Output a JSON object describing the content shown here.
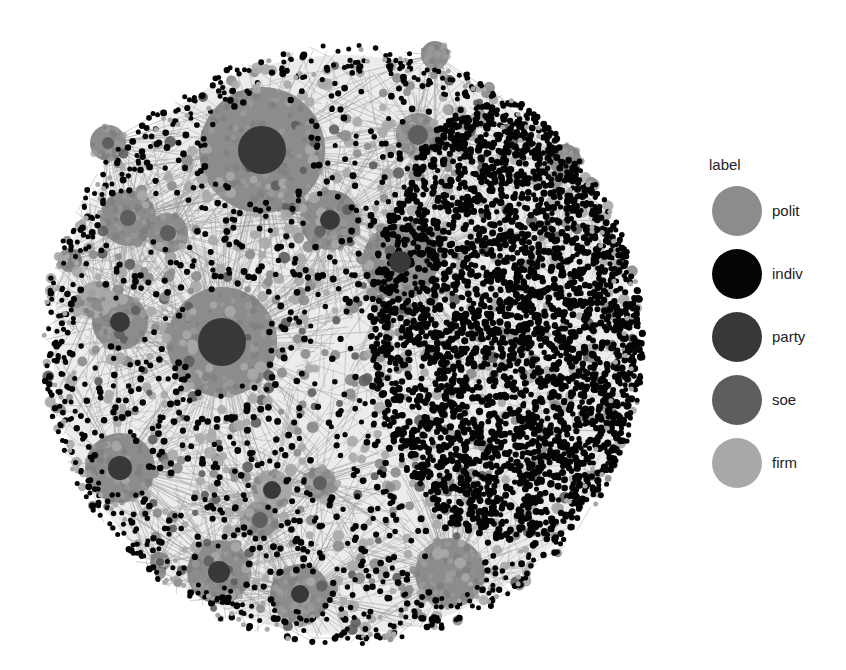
{
  "chart_data": {
    "type": "network",
    "title": "",
    "legend": {
      "title": "label",
      "position": "right",
      "entries": [
        {
          "key": "polit",
          "color": "#8c8c8c"
        },
        {
          "key": "indiv",
          "color": "#050505"
        },
        {
          "key": "party",
          "color": "#383838"
        },
        {
          "key": "soe",
          "color": "#5e5e5e"
        },
        {
          "key": "firm",
          "color": "#a8a8a8"
        }
      ]
    },
    "layout": {
      "center": [
        343,
        345
      ],
      "radius": 300
    },
    "hubs": [
      {
        "x": 262,
        "y": 150,
        "r": 63,
        "core_r": 24,
        "core": "party",
        "halo": "polit"
      },
      {
        "x": 222,
        "y": 342,
        "r": 55,
        "core_r": 24,
        "core": "party",
        "halo": "polit"
      },
      {
        "x": 120,
        "y": 468,
        "r": 35,
        "core_r": 12,
        "core": "party",
        "halo": "polit"
      },
      {
        "x": 219,
        "y": 572,
        "r": 32,
        "core_r": 11,
        "core": "party",
        "halo": "polit"
      },
      {
        "x": 300,
        "y": 594,
        "r": 30,
        "core_r": 9,
        "core": "party",
        "halo": "polit"
      },
      {
        "x": 450,
        "y": 573,
        "r": 35,
        "core_r": 0,
        "core": "party",
        "halo": "polit"
      },
      {
        "x": 400,
        "y": 262,
        "r": 38,
        "core_r": 11,
        "core": "party",
        "halo": "polit"
      },
      {
        "x": 330,
        "y": 220,
        "r": 30,
        "core_r": 10,
        "core": "party",
        "halo": "polit"
      },
      {
        "x": 418,
        "y": 135,
        "r": 22,
        "core_r": 10,
        "core": "soe",
        "halo": "polit"
      },
      {
        "x": 120,
        "y": 322,
        "r": 28,
        "core_r": 10,
        "core": "party",
        "halo": "polit"
      },
      {
        "x": 128,
        "y": 218,
        "r": 28,
        "core_r": 8,
        "core": "soe",
        "halo": "polit"
      },
      {
        "x": 108,
        "y": 143,
        "r": 18,
        "core_r": 6,
        "core": "soe",
        "halo": "polit"
      },
      {
        "x": 168,
        "y": 233,
        "r": 20,
        "core_r": 8,
        "core": "soe",
        "halo": "polit"
      },
      {
        "x": 272,
        "y": 490,
        "r": 20,
        "core_r": 9,
        "core": "party",
        "halo": "firm"
      },
      {
        "x": 260,
        "y": 520,
        "r": 18,
        "core_r": 8,
        "core": "soe",
        "halo": "polit"
      },
      {
        "x": 320,
        "y": 483,
        "r": 16,
        "core_r": 7,
        "core": "soe",
        "halo": "polit"
      },
      {
        "x": 160,
        "y": 562,
        "r": 10,
        "core_r": 4,
        "core": "soe",
        "halo": "polit"
      },
      {
        "x": 435,
        "y": 55,
        "r": 14,
        "core_r": 0,
        "core": "party",
        "halo": "polit"
      },
      {
        "x": 565,
        "y": 160,
        "r": 16,
        "core_r": 0,
        "core": "party",
        "halo": "polit"
      },
      {
        "x": 95,
        "y": 300,
        "r": 18,
        "core_r": 0,
        "core": "party",
        "halo": "firm"
      },
      {
        "x": 70,
        "y": 260,
        "r": 12,
        "core_r": 0,
        "core": "party",
        "halo": "polit"
      }
    ],
    "node_counts": {
      "indiv_dense_region": 2600,
      "peripheral": 500,
      "light": 900
    },
    "dense_region": {
      "x": 510,
      "y": 320,
      "rx": 140,
      "ry": 220
    }
  }
}
